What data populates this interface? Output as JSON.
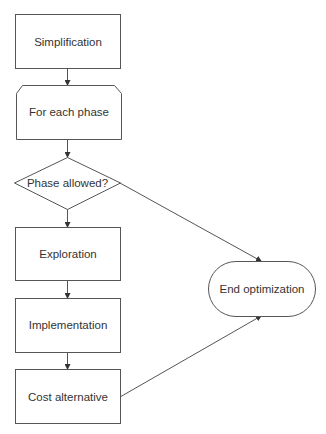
{
  "diagram": {
    "type": "flowchart",
    "stroke_color": "#555555",
    "text_color": "#333333",
    "background": "#ffffff",
    "nodes": [
      {
        "id": "simplification",
        "shape": "process",
        "label": "Simplification"
      },
      {
        "id": "for-each-phase",
        "shape": "loop-limit",
        "label": "For each phase"
      },
      {
        "id": "phase-allowed",
        "shape": "decision",
        "label": "Phase allowed?"
      },
      {
        "id": "exploration",
        "shape": "process",
        "label": "Exploration"
      },
      {
        "id": "implementation",
        "shape": "process",
        "label": "Implementation"
      },
      {
        "id": "cost-alternative",
        "shape": "process",
        "label": "Cost alternative"
      },
      {
        "id": "end-optimization",
        "shape": "terminator",
        "label": "End optimization"
      }
    ],
    "edges": [
      {
        "from": "simplification",
        "to": "for-each-phase"
      },
      {
        "from": "for-each-phase",
        "to": "phase-allowed"
      },
      {
        "from": "phase-allowed",
        "to": "exploration"
      },
      {
        "from": "phase-allowed",
        "to": "end-optimization"
      },
      {
        "from": "exploration",
        "to": "implementation"
      },
      {
        "from": "implementation",
        "to": "cost-alternative"
      },
      {
        "from": "cost-alternative",
        "to": "end-optimization"
      }
    ]
  }
}
